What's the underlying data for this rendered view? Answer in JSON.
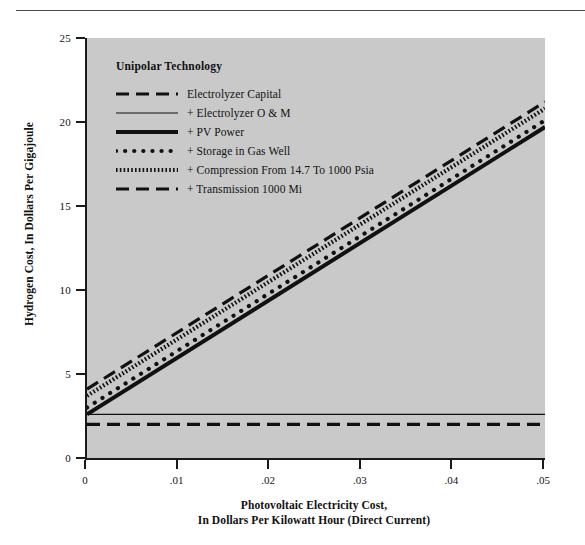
{
  "chart_data": {
    "type": "line",
    "title": "Unipolar Technology",
    "xlabel": "Photovoltaic Electricity Cost, In Dollars Per Kilowatt Hour (Direct Current)",
    "ylabel": "Hydrogen Cost, In Dollars Per Gigajoule",
    "xlim": [
      0,
      0.05
    ],
    "ylim": [
      0,
      25
    ],
    "xticks": [
      "0",
      ".01",
      ".02",
      ".03",
      ".04",
      ".05"
    ],
    "xtick_values": [
      0,
      0.01,
      0.02,
      0.03,
      0.04,
      0.05
    ],
    "yticks": [
      "0",
      "5",
      "10",
      "15",
      "20",
      "25"
    ],
    "ytick_values": [
      0,
      5,
      10,
      15,
      20,
      25
    ],
    "grid": false,
    "legend_position": "upper-left-inside",
    "plot_background": "#c9c9c9",
    "line_color": "#111111",
    "x": [
      0,
      0.05
    ],
    "series": [
      {
        "name": "Electrolyzer Capital",
        "style": "dashed",
        "values": [
          2.0,
          2.0
        ]
      },
      {
        "name": "+ Electrolyzer O & M",
        "style": "thin-solid",
        "values": [
          2.6,
          2.6
        ]
      },
      {
        "name": "+ PV Power",
        "style": "thick-solid",
        "values": [
          2.6,
          19.7
        ]
      },
      {
        "name": "+ Storage in Gas Well",
        "style": "dotted",
        "values": [
          3.0,
          20.1
        ]
      },
      {
        "name": "+ Compression From 14.7 To 1000 Psia",
        "style": "hatched",
        "values": [
          3.7,
          20.8
        ]
      },
      {
        "name": "+ Transmission 1000 Mi",
        "style": "dashed",
        "values": [
          4.1,
          21.2
        ]
      }
    ]
  },
  "axes": {
    "y_title": "Hydrogen Cost, In Dollars Per Gigajoule",
    "x_title_line1": "Photovoltaic Electricity Cost,",
    "x_title_line2": "In Dollars Per Kilowatt Hour (Direct Current)",
    "yticks": [
      {
        "label": "25",
        "value": 25
      },
      {
        "label": "20",
        "value": 20
      },
      {
        "label": "15",
        "value": 15
      },
      {
        "label": "10",
        "value": 10
      },
      {
        "label": "5",
        "value": 5
      },
      {
        "label": "0",
        "value": 0
      }
    ],
    "xticks": [
      {
        "label": "0",
        "value": 0
      },
      {
        "label": ".01",
        "value": 0.01
      },
      {
        "label": ".02",
        "value": 0.02
      },
      {
        "label": ".03",
        "value": 0.03
      },
      {
        "label": ".04",
        "value": 0.04
      },
      {
        "label": ".05",
        "value": 0.05
      }
    ]
  },
  "legend": {
    "title": "Unipolar Technology",
    "entries": [
      {
        "label": "Electrolyzer Capital",
        "style": "dashed"
      },
      {
        "label": "+ Electrolyzer O & M",
        "style": "thin-solid"
      },
      {
        "label": "+ PV Power",
        "style": "thick-solid"
      },
      {
        "label": "+ Storage in Gas Well",
        "style": "dotted"
      },
      {
        "label": "+ Compression From 14.7 To 1000 Psia",
        "style": "hatched"
      },
      {
        "label": "+ Transmission 1000 Mi",
        "style": "dashed"
      }
    ]
  }
}
